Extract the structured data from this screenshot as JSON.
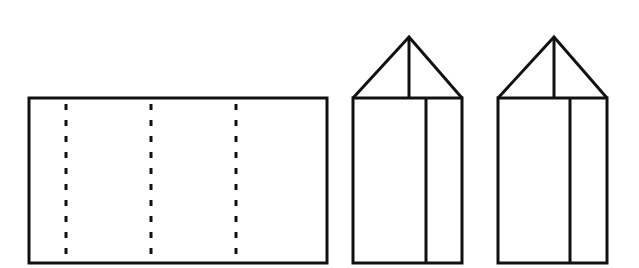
{
  "diagram": {
    "stroke_color": "#111111",
    "background": "#ffffff",
    "net": {
      "x": 29,
      "y": 98,
      "width": 298,
      "height": 165,
      "fold_lines_x": [
        66,
        151,
        236
      ]
    },
    "prisms": [
      {
        "left": 353,
        "right": 462,
        "top": 98,
        "bottom": 263,
        "apex_x": 409,
        "apex_y": 37,
        "inner_x": 426
      },
      {
        "left": 498,
        "right": 607,
        "top": 98,
        "bottom": 263,
        "apex_x": 554,
        "apex_y": 37,
        "inner_x": 570
      }
    ]
  }
}
